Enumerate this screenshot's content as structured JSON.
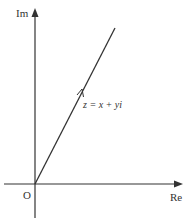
{
  "diagram": {
    "type": "argand-diagram",
    "axes": {
      "real_label": "Re",
      "imaginary_label": "Im",
      "origin_label": "O"
    },
    "vector": {
      "label": "z = x + yi",
      "direction": "from origin up-right"
    },
    "colors": {
      "stroke": "#333333",
      "background": "#ffffff"
    }
  }
}
